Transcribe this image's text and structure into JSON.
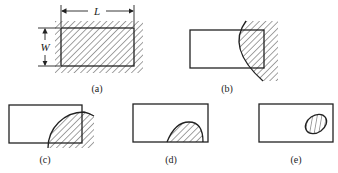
{
  "figure": {
    "panels": [
      {
        "id": "a",
        "label": "(a)",
        "description": "Rectangle of length L and width W fully surrounded and covered by hatched region"
      },
      {
        "id": "b",
        "label": "(b)",
        "description": "Hatched region with curved boundary covering right end of rectangle"
      },
      {
        "id": "c",
        "label": "(c)",
        "description": "Hatched quarter-circle region covering lower-right corner of rectangle"
      },
      {
        "id": "d",
        "label": "(d)",
        "description": "Hatched semi-elliptical region sitting on bottom edge inside rectangle"
      },
      {
        "id": "e",
        "label": "(e)",
        "description": "Small hatched elliptical region fully inside rectangle"
      }
    ],
    "dimensions": {
      "length_symbol": "L",
      "width_symbol": "W"
    }
  }
}
